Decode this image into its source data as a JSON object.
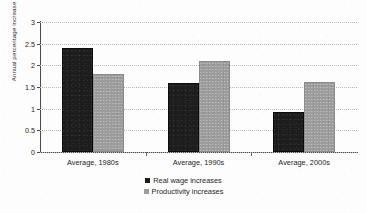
{
  "chart_data": {
    "type": "bar",
    "title": "",
    "subtitle": "",
    "xlabel": "",
    "ylabel": "Annual percentage increase",
    "categories": [
      "Average, 1980s",
      "Average, 1990s",
      "Average, 2000s"
    ],
    "series": [
      {
        "name": "Real wage increases",
        "color": "#1d1d1d",
        "values": [
          2.4,
          1.6,
          0.93
        ]
      },
      {
        "name": "Productivity increases",
        "color": "#9c9c9c",
        "values": [
          1.8,
          2.1,
          1.62
        ]
      }
    ],
    "ylim": [
      0,
      3
    ],
    "y_ticks": [
      0,
      0.5,
      1,
      1.5,
      2,
      2.5,
      3
    ],
    "y_tick_labels": [
      "0",
      "0.5",
      "1",
      "1.5",
      "2",
      "2.5",
      "3"
    ],
    "grid": true,
    "grid_style": "dotted-horizontal",
    "legend_position": "bottom-center",
    "bar_gap_within_group": 0
  },
  "legend": {
    "items": [
      {
        "label": "Real wage increases",
        "swatch": "dark"
      },
      {
        "label": "Productivity increases",
        "swatch": "gray"
      }
    ]
  }
}
